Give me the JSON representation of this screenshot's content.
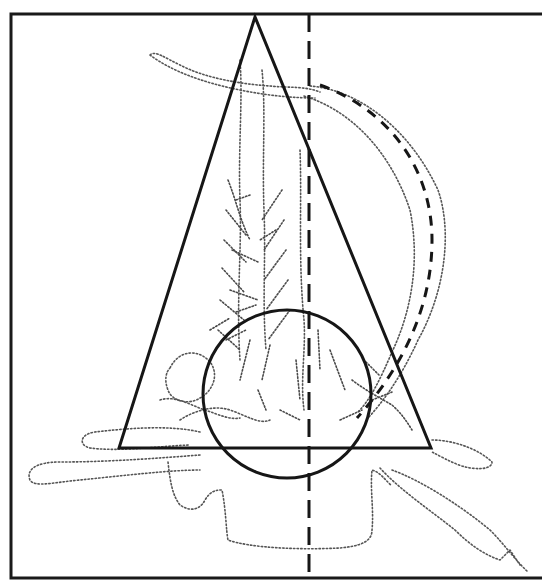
{
  "figure": {
    "caption_fragment": "",
    "colors": {
      "lines": "#161616",
      "dotted_outline": "#555555",
      "background": "#ffffff"
    },
    "frame": {
      "left": 11,
      "top": 14,
      "right": 541,
      "bottom": 578
    },
    "shapes": {
      "triangle": {
        "label": "triangle",
        "apex": [
          255,
          17
        ],
        "left": [
          119,
          448
        ],
        "right": [
          431,
          448
        ],
        "style": "solid"
      },
      "circle": {
        "label": "circle",
        "center": [
          287,
          394
        ],
        "radius": 84,
        "style": "solid"
      },
      "vertical_line": {
        "label": "vertical-axis",
        "x": 309,
        "y1": 14,
        "y2": 574,
        "style": "dashed"
      },
      "curve": {
        "label": "arc",
        "start": [
          320,
          85
        ],
        "end": [
          357,
          418
        ],
        "style": "dashed"
      }
    }
  }
}
